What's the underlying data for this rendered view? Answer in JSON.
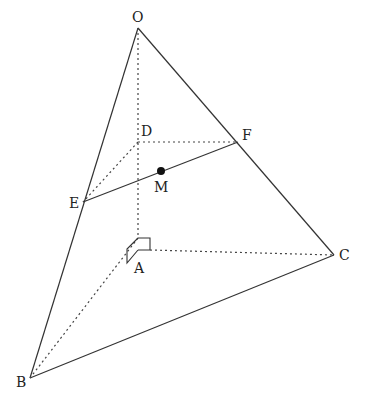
{
  "diagram": {
    "type": "3d-pyramid",
    "points": {
      "O": {
        "label": "O",
        "x": 138,
        "y": 28
      },
      "A": {
        "label": "A",
        "x": 138,
        "y": 238
      },
      "B": {
        "label": "B",
        "x": 30,
        "y": 378
      },
      "C": {
        "label": "C",
        "x": 334,
        "y": 255
      },
      "D": {
        "label": "D",
        "x": 138,
        "y": 142
      },
      "E": {
        "label": "E",
        "x": 83,
        "y": 202
      },
      "F": {
        "label": "F",
        "x": 238,
        "y": 142
      },
      "M": {
        "label": "M",
        "x": 161,
        "y": 171
      }
    },
    "solid_edges": [
      [
        "O",
        "B"
      ],
      [
        "O",
        "C"
      ],
      [
        "B",
        "C"
      ],
      [
        "E",
        "F"
      ]
    ],
    "dashed_edges": [
      [
        "O",
        "A"
      ],
      [
        "A",
        "B"
      ],
      [
        "A",
        "C"
      ],
      [
        "D",
        "E"
      ],
      [
        "D",
        "F"
      ]
    ],
    "right_angle_mark_at": "A",
    "highlighted_point": "M"
  }
}
